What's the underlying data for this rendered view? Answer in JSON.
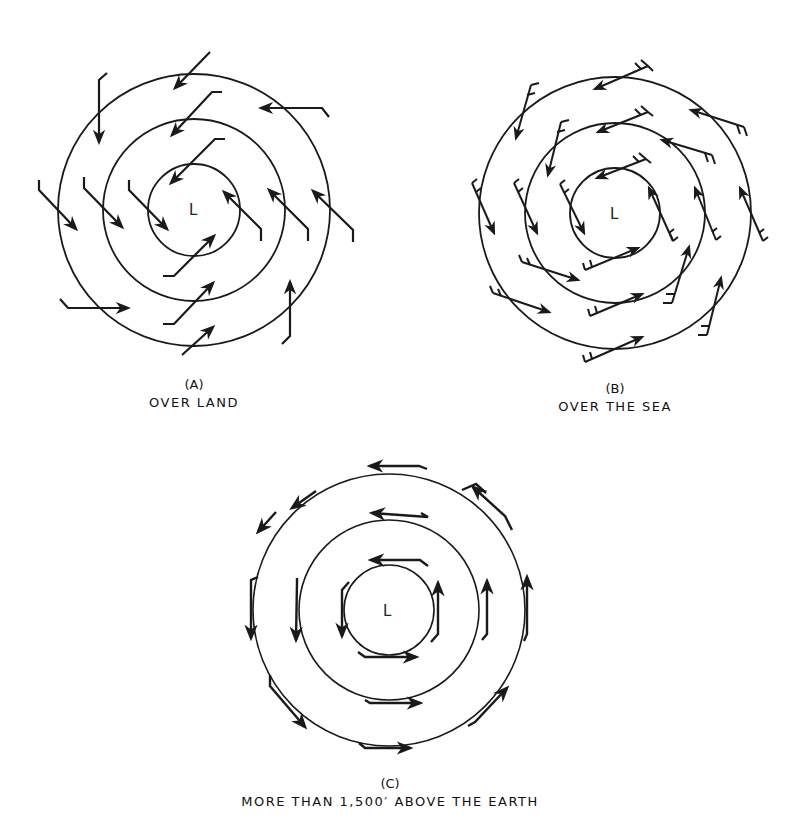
{
  "figure": {
    "panels": [
      {
        "id": "A",
        "letter": "(A)",
        "caption": "OVER LAND",
        "center_label": "L",
        "center": [
          194,
          210
        ],
        "radii": [
          46,
          91,
          136
        ],
        "arrow_style": "shaft with single hook tail, strongly inflowing"
      },
      {
        "id": "B",
        "letter": "(B)",
        "caption": "OVER THE SEA",
        "center_label": "L",
        "center": [
          615,
          213
        ],
        "radii": [
          45,
          90,
          136
        ],
        "arrow_style": "shaft with feathered barbs, slightly inflowing"
      },
      {
        "id": "C",
        "letter": "(C)",
        "caption": "MORE THAN 1,500′ ABOVE THE EARTH",
        "center_label": "L",
        "center": [
          389,
          610
        ],
        "radii": [
          45,
          90,
          136
        ],
        "arrow_style": "arrows tangent to circles, counterclockwise flow"
      }
    ],
    "colors": {
      "line": "#1a1a1a",
      "background": "#ffffff"
    }
  }
}
